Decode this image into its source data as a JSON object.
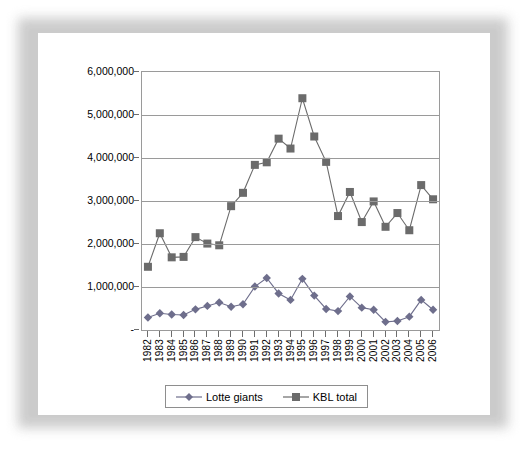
{
  "chart_data": {
    "type": "line",
    "title": "",
    "subtitle": "",
    "xlabel": "",
    "ylabel": "",
    "categories": [
      "1982",
      "1983",
      "1984",
      "1985",
      "1986",
      "1987",
      "1988",
      "1989",
      "1990",
      "1991",
      "1992",
      "1993",
      "1994",
      "1995",
      "1996",
      "1997",
      "1998",
      "1999",
      "2000",
      "2001",
      "2002",
      "2003",
      "2004",
      "2005",
      "2006"
    ],
    "ylim": [
      0,
      6000000
    ],
    "ytick_values": [
      0,
      1000000,
      2000000,
      3000000,
      4000000,
      5000000,
      6000000
    ],
    "ytick_labels": [
      "-",
      "1,000,000",
      "2,000,000",
      "3,000,000",
      "4,000,000",
      "5,000,000",
      "6,000,000"
    ],
    "grid": true,
    "legend_position": "bottom",
    "series": [
      {
        "name": "Lotte giants",
        "marker": "diamond",
        "color": "#6e6e8c",
        "values": [
          290000,
          390000,
          360000,
          350000,
          480000,
          560000,
          640000,
          540000,
          600000,
          1010000,
          1210000,
          850000,
          700000,
          1190000,
          800000,
          490000,
          440000,
          780000,
          520000,
          470000,
          190000,
          210000,
          310000,
          700000,
          470000
        ]
      },
      {
        "name": "KBL total",
        "marker": "square",
        "color": "#6b6b6b",
        "values": [
          1470000,
          2250000,
          1690000,
          1700000,
          2160000,
          2010000,
          1970000,
          2880000,
          3190000,
          3840000,
          3900000,
          4450000,
          4220000,
          5390000,
          4500000,
          3910000,
          2650000,
          3210000,
          2510000,
          2990000,
          2400000,
          2720000,
          2320000,
          3370000,
          3040000
        ]
      }
    ]
  },
  "legend": {
    "items": [
      {
        "label": "Lotte giants"
      },
      {
        "label": "KBL total"
      }
    ]
  }
}
